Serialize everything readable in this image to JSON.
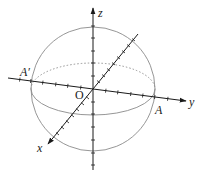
{
  "diagram": {
    "type": "3d-coordinate-sphere",
    "colors": {
      "axis": "#1a1a1a",
      "sphere": "#8a8a8a",
      "background": "#ffffff"
    },
    "labels": {
      "z_axis": "z",
      "y_axis": "y",
      "x_axis": "x",
      "origin": "O",
      "point_a": "A",
      "point_a_prime": "A′"
    },
    "geometry": {
      "origin": [
        93,
        89
      ],
      "sphere_radius": 62,
      "equator_ry": 26
    }
  }
}
